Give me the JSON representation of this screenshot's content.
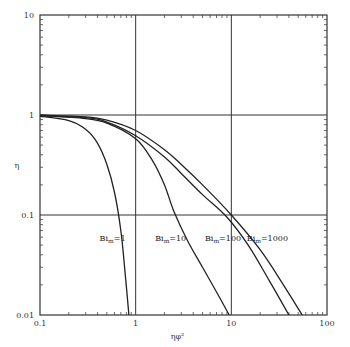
{
  "chart_data": {
    "type": "line",
    "title": "",
    "xlabel": "ηφ²",
    "ylabel": "η",
    "xscale": "log",
    "yscale": "log",
    "xlim": [
      0.1,
      100
    ],
    "ylim": [
      0.01,
      10
    ],
    "grid": "major decades",
    "x_ticks": [
      "0.1",
      "1",
      "10",
      "100"
    ],
    "y_ticks": [
      "0.01",
      "0.1",
      "1",
      "10"
    ],
    "series": [
      {
        "name": "Bi_m=1",
        "label": "Bi",
        "sub": "m",
        "suffix": "=1",
        "points": [
          [
            0.1,
            0.97
          ],
          [
            0.2,
            0.88
          ],
          [
            0.3,
            0.72
          ],
          [
            0.4,
            0.52
          ],
          [
            0.5,
            0.32
          ],
          [
            0.6,
            0.17
          ],
          [
            0.7,
            0.07
          ],
          [
            0.78,
            0.025
          ],
          [
            0.85,
            0.01
          ]
        ]
      },
      {
        "name": "Bi_m=10",
        "label": "Bi",
        "sub": "m",
        "suffix": "=10",
        "points": [
          [
            0.1,
            0.98
          ],
          [
            0.3,
            0.92
          ],
          [
            0.5,
            0.83
          ],
          [
            1,
            0.58
          ],
          [
            1.5,
            0.35
          ],
          [
            2,
            0.2
          ],
          [
            2.5,
            0.11
          ],
          [
            3.5,
            0.055
          ],
          [
            5,
            0.03
          ],
          [
            7,
            0.017
          ],
          [
            9.5,
            0.01
          ]
        ]
      },
      {
        "name": "Bi_m=100",
        "label": "Bi",
        "sub": "m",
        "suffix": "=100",
        "points": [
          [
            0.1,
            0.99
          ],
          [
            0.3,
            0.94
          ],
          [
            0.5,
            0.85
          ],
          [
            1,
            0.62
          ],
          [
            2,
            0.38
          ],
          [
            3,
            0.26
          ],
          [
            5,
            0.16
          ],
          [
            9,
            0.095
          ],
          [
            15,
            0.05
          ],
          [
            25,
            0.022
          ],
          [
            40,
            0.01
          ]
        ]
      },
      {
        "name": "Bi_m=1000",
        "label": "Bi",
        "sub": "m",
        "suffix": "=1000",
        "points": [
          [
            0.1,
            1.0
          ],
          [
            0.3,
            0.96
          ],
          [
            0.5,
            0.89
          ],
          [
            1,
            0.7
          ],
          [
            2,
            0.45
          ],
          [
            3,
            0.32
          ],
          [
            5,
            0.2
          ],
          [
            10,
            0.1
          ],
          [
            20,
            0.045
          ],
          [
            35,
            0.02
          ],
          [
            55,
            0.01
          ]
        ]
      }
    ],
    "curve_label_positions": [
      {
        "series": 0,
        "x": 0.42,
        "y": 0.055
      },
      {
        "series": 1,
        "x": 1.6,
        "y": 0.055
      },
      {
        "series": 2,
        "x": 5.3,
        "y": 0.055
      },
      {
        "series": 3,
        "x": 14.5,
        "y": 0.055
      }
    ]
  }
}
